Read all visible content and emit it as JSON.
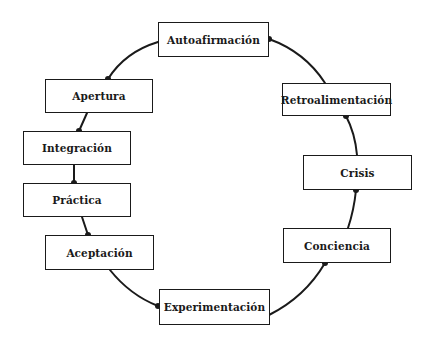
{
  "diagram": {
    "type": "cycle",
    "line_color": "#1a1a1a",
    "background": "#ffffff",
    "nodes": [
      {
        "id": "autoafirmacion",
        "label": "Autoafirmación",
        "x": 158,
        "y": 22,
        "w": 111,
        "h": 35
      },
      {
        "id": "retroalimentacion",
        "label": "Retroalimentación",
        "x": 282,
        "y": 83,
        "w": 109,
        "h": 33
      },
      {
        "id": "crisis",
        "label": "Crisis",
        "x": 303,
        "y": 155,
        "w": 109,
        "h": 35
      },
      {
        "id": "conciencia",
        "label": "Conciencia",
        "x": 283,
        "y": 228,
        "w": 108,
        "h": 35
      },
      {
        "id": "experimentacion",
        "label": "Experimentación",
        "x": 159,
        "y": 289,
        "w": 111,
        "h": 36
      },
      {
        "id": "aceptacion",
        "label": "Aceptación",
        "x": 45,
        "y": 235,
        "w": 109,
        "h": 35
      },
      {
        "id": "practica",
        "label": "Práctica",
        "x": 23,
        "y": 183,
        "w": 108,
        "h": 34
      },
      {
        "id": "integracion",
        "label": "Integración",
        "x": 23,
        "y": 131,
        "w": 108,
        "h": 34
      },
      {
        "id": "apertura",
        "label": "Apertura",
        "x": 45,
        "y": 79,
        "w": 108,
        "h": 34
      }
    ],
    "edges": [
      {
        "from": "autoafirmacion",
        "to": "retroalimentacion"
      },
      {
        "from": "retroalimentacion",
        "to": "crisis"
      },
      {
        "from": "crisis",
        "to": "conciencia"
      },
      {
        "from": "conciencia",
        "to": "experimentacion"
      },
      {
        "from": "experimentacion",
        "to": "aceptacion"
      },
      {
        "from": "aceptacion",
        "to": "practica"
      },
      {
        "from": "practica",
        "to": "integracion"
      },
      {
        "from": "integracion",
        "to": "apertura"
      },
      {
        "from": "apertura",
        "to": "autoafirmacion"
      }
    ]
  }
}
